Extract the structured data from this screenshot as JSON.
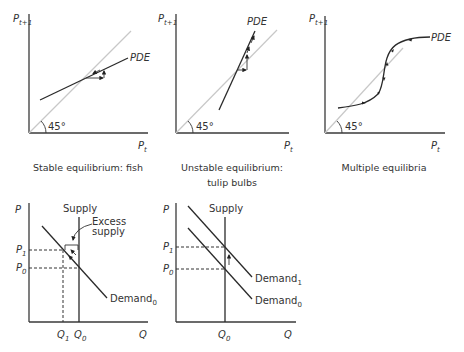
{
  "panels": {
    "stable": {
      "y_axis_label": "P",
      "y_axis_sub": "t+1",
      "x_axis_label": "P",
      "x_axis_sub": "t",
      "curve_label": "PDE",
      "angle_label": "45°",
      "caption_line1": "Stable equilibrium: fish",
      "caption_line2": ""
    },
    "unstable": {
      "y_axis_label": "P",
      "y_axis_sub": "t+1",
      "x_axis_label": "P",
      "x_axis_sub": "t",
      "curve_label": "PDE",
      "angle_label": "45°",
      "caption_line1": "Unstable equilibrium:",
      "caption_line2": "tulip bulbs"
    },
    "multiple": {
      "y_axis_label": "P",
      "y_axis_sub": "t+1",
      "x_axis_label": "P",
      "x_axis_sub": "t",
      "curve_label": "PDE",
      "angle_label": "45°",
      "caption_line1": "Multiple equilibria",
      "caption_line2": ""
    },
    "excess_supply": {
      "y_axis_label": "P",
      "x_axis_label": "Q",
      "supply_label": "Supply",
      "demand_label": "Demand",
      "demand_sub": "0",
      "annotation_line1": "Excess",
      "annotation_line2": "supply",
      "p1_label": "P",
      "p1_sub": "1",
      "p0_label": "P",
      "p0_sub": "0",
      "q1_label": "Q",
      "q1_sub": "1",
      "q0_label": "Q",
      "q0_sub": "0"
    },
    "demand_shift": {
      "y_axis_label": "P",
      "x_axis_label": "Q",
      "supply_label": "Supply",
      "demand1_label": "Demand",
      "demand1_sub": "1",
      "demand0_label": "Demand",
      "demand0_sub": "0",
      "p1_label": "P",
      "p1_sub": "1",
      "p0_label": "P",
      "p0_sub": "0",
      "q0_label": "Q",
      "q0_sub": "0"
    }
  }
}
